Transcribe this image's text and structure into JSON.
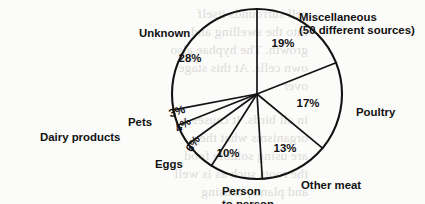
{
  "chart_data": {
    "type": "pie",
    "title": "",
    "subtitle": "",
    "xlabel": "",
    "ylabel": "",
    "legend_position": "none",
    "grid": false,
    "units": "percent",
    "total": 100,
    "start_angle_deg": 0,
    "direction": "clockwise",
    "categories": [
      "Miscellaneous (50 different sources)",
      "Poultry",
      "Other meat",
      "Person to person",
      "Eggs",
      "Dairy products",
      "Pets",
      "Unknown"
    ],
    "values": [
      19,
      17,
      13,
      10,
      6,
      4,
      3,
      28
    ],
    "slices": [
      {
        "label": "Miscellaneous",
        "label_line2": "(50 different sources)",
        "value": 19,
        "value_text": "19%",
        "label_x": 299,
        "label_y": 12,
        "label2_x": 299,
        "label2_y": 25,
        "pct_x": 283,
        "pct_y": 47,
        "pct_rotate": 0,
        "label_anchor": "start"
      },
      {
        "label": "Poultry",
        "label_line2": "",
        "value": 17,
        "value_text": "17%",
        "label_x": 356,
        "label_y": 107,
        "label2_x": 0,
        "label2_y": 0,
        "pct_x": 308,
        "pct_y": 107,
        "pct_rotate": 0,
        "label_anchor": "start"
      },
      {
        "label": "Other meat",
        "label_line2": "",
        "value": 13,
        "value_text": "13%",
        "label_x": 301,
        "label_y": 180,
        "label2_x": 0,
        "label2_y": 0,
        "pct_x": 285,
        "pct_y": 152,
        "pct_rotate": 0,
        "label_anchor": "start"
      },
      {
        "label": "Person",
        "label_line2": "to person",
        "value": 10,
        "value_text": "10%",
        "label_x": 222,
        "label_y": 186,
        "label2_x": 222,
        "label2_y": 199,
        "pct_x": 228,
        "pct_y": 157,
        "pct_rotate": 0,
        "label_anchor": "start"
      },
      {
        "label": "Eggs",
        "label_line2": "",
        "value": 6,
        "value_text": "6%",
        "label_x": 155,
        "label_y": 159,
        "label2_x": 0,
        "label2_y": 0,
        "pct_x": 196,
        "pct_y": 146,
        "pct_rotate": -56,
        "label_anchor": "start"
      },
      {
        "label": "Dairy products",
        "label_line2": "",
        "value": 4,
        "value_text": "4%",
        "label_x": 40,
        "label_y": 132,
        "label2_x": 0,
        "label2_y": 0,
        "pct_x": 185,
        "pct_y": 128,
        "pct_rotate": -36,
        "label_anchor": "start"
      },
      {
        "label": "Pets",
        "label_line2": "",
        "value": 3,
        "value_text": "3%",
        "label_x": 128,
        "label_y": 117,
        "label2_x": 0,
        "label2_y": 0,
        "pct_x": 178,
        "pct_y": 115,
        "pct_rotate": -18,
        "label_anchor": "start"
      },
      {
        "label": "Unknown",
        "label_line2": "",
        "value": 28,
        "value_text": "28%",
        "label_x": 139,
        "label_y": 28,
        "label2_x": 0,
        "label2_y": 0,
        "pct_x": 190,
        "pct_y": 62,
        "pct_rotate": 0,
        "label_anchor": "start"
      }
    ],
    "geometry": {
      "center_x": 257,
      "center_y": 94,
      "radius": 85
    },
    "colors": {
      "stroke": "#131313",
      "fill": "#ffffff",
      "text": "#111111",
      "background": "#fbfbfa"
    }
  },
  "background_bleed": {
    "description": "faint mirrored show-through text from the reverse side of the scanned page",
    "lines": [
      {
        "text": "cell surrounds itself",
        "x": 8,
        "y": 6
      },
      {
        "text": "into the swelling and",
        "x": 8,
        "y": 24
      },
      {
        "text": "growth. The hyphae also",
        "x": 8,
        "y": 42
      },
      {
        "text": "own cells. At this stage",
        "x": 8,
        "y": 60
      },
      {
        "text": "over",
        "x": 8,
        "y": 78
      },
      {
        "text": "in all birds. It causes a",
        "x": 8,
        "y": 112
      },
      {
        "text": "organisms what they",
        "x": 8,
        "y": 130
      },
      {
        "text": "are using soluble food",
        "x": 8,
        "y": 148
      },
      {
        "text": "the roots such as is well",
        "x": 8,
        "y": 166
      },
      {
        "text": "and plants, causing",
        "x": 8,
        "y": 184
      }
    ]
  }
}
